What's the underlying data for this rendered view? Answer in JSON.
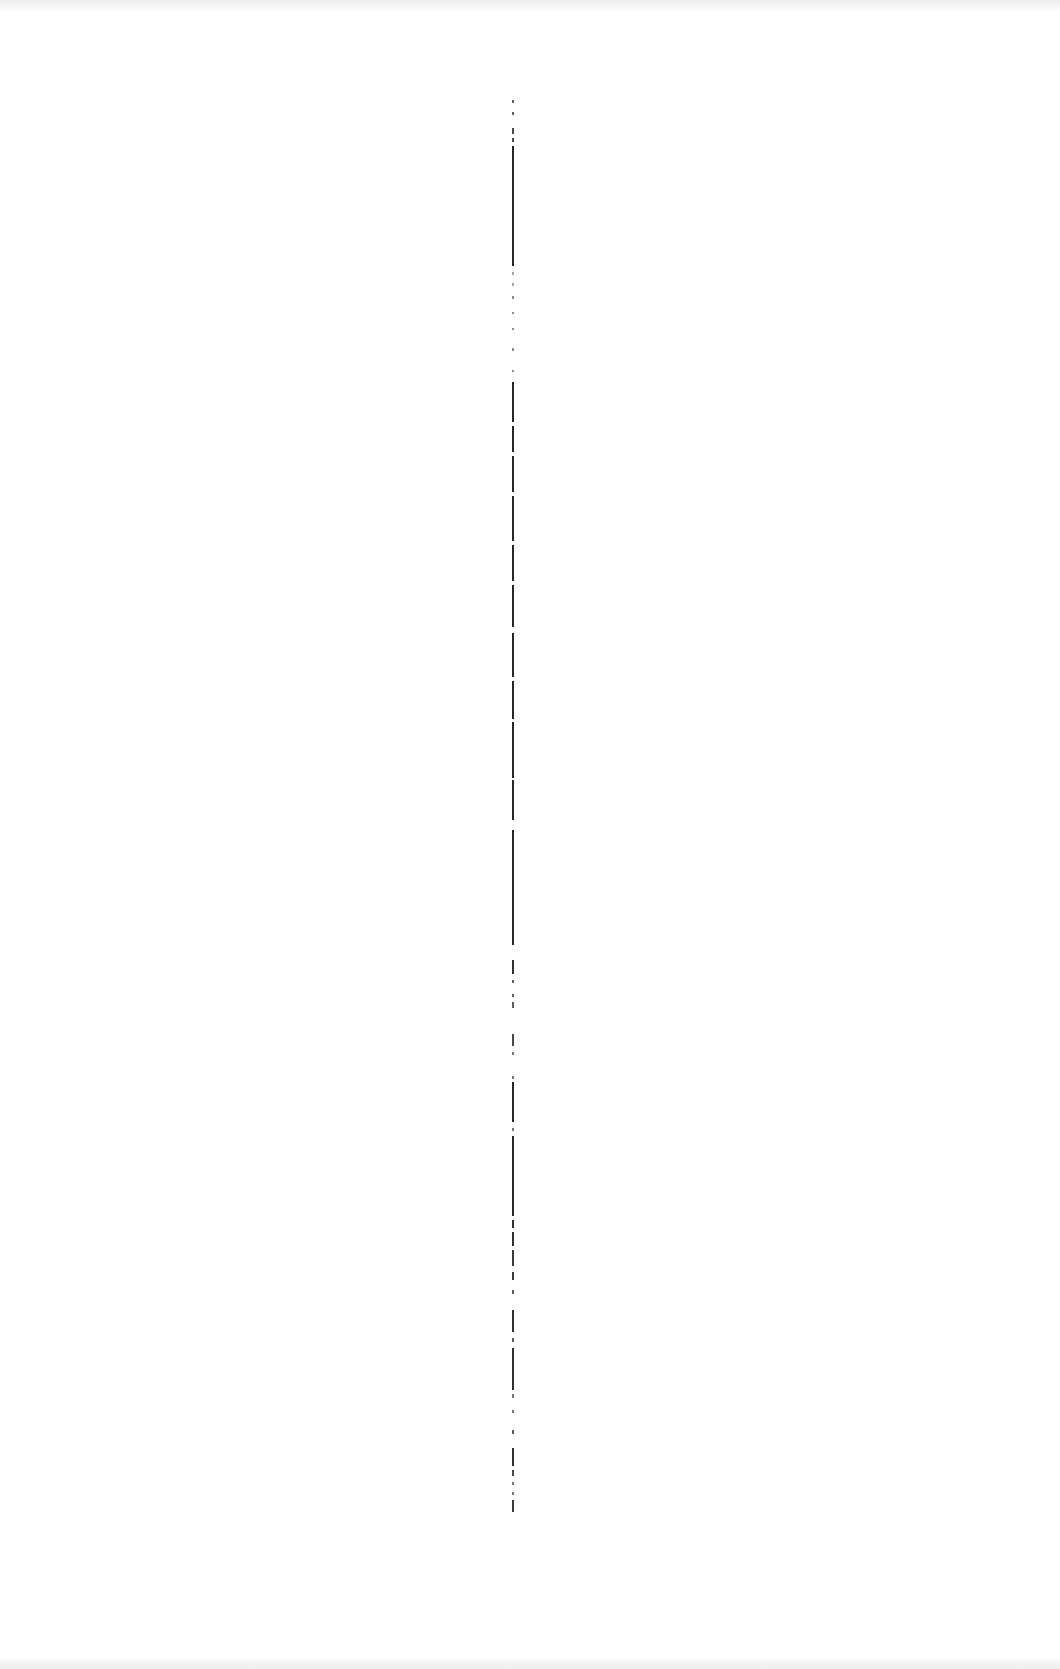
{
  "page": {
    "type": "scanned-page",
    "background": "#ffffff",
    "edge_band_color": "#ededed",
    "text_content": "",
    "legible_text": []
  },
  "column_rule": {
    "x": 512,
    "top": 100,
    "bottom": 1515,
    "color": "#1a1a1a",
    "segments": [
      {
        "y": 100,
        "h": 3,
        "op": 0.7
      },
      {
        "y": 112,
        "h": 3,
        "op": 0.7
      },
      {
        "y": 128,
        "h": 6,
        "op": 0.8
      },
      {
        "y": 138,
        "h": 4,
        "op": 0.8
      },
      {
        "y": 146,
        "h": 120,
        "op": 0.95
      },
      {
        "y": 272,
        "h": 3,
        "op": 0.4
      },
      {
        "y": 283,
        "h": 3,
        "op": 0.4
      },
      {
        "y": 296,
        "h": 3,
        "op": 0.5
      },
      {
        "y": 312,
        "h": 2,
        "op": 0.5
      },
      {
        "y": 328,
        "h": 2,
        "op": 0.5
      },
      {
        "y": 348,
        "h": 3,
        "op": 0.5
      },
      {
        "y": 370,
        "h": 2,
        "op": 0.5
      },
      {
        "y": 382,
        "h": 40,
        "op": 0.95
      },
      {
        "y": 426,
        "h": 26,
        "op": 0.95
      },
      {
        "y": 456,
        "h": 36,
        "op": 0.95
      },
      {
        "y": 496,
        "h": 45,
        "op": 0.95
      },
      {
        "y": 545,
        "h": 36,
        "op": 0.95
      },
      {
        "y": 585,
        "h": 42,
        "op": 0.95
      },
      {
        "y": 633,
        "h": 44,
        "op": 0.95
      },
      {
        "y": 681,
        "h": 38,
        "op": 0.95
      },
      {
        "y": 722,
        "h": 56,
        "op": 0.95
      },
      {
        "y": 780,
        "h": 40,
        "op": 0.95
      },
      {
        "y": 830,
        "h": 115,
        "op": 0.95
      },
      {
        "y": 960,
        "h": 14,
        "op": 0.9
      },
      {
        "y": 980,
        "h": 3,
        "op": 0.7
      },
      {
        "y": 994,
        "h": 3,
        "op": 0.7
      },
      {
        "y": 1002,
        "h": 6,
        "op": 0.7
      },
      {
        "y": 1034,
        "h": 12,
        "op": 0.8
      },
      {
        "y": 1052,
        "h": 3,
        "op": 0.6
      },
      {
        "y": 1076,
        "h": 3,
        "op": 0.6
      },
      {
        "y": 1082,
        "h": 40,
        "op": 0.95
      },
      {
        "y": 1128,
        "h": 3,
        "op": 0.6
      },
      {
        "y": 1136,
        "h": 80,
        "op": 0.95
      },
      {
        "y": 1220,
        "h": 8,
        "op": 0.9
      },
      {
        "y": 1232,
        "h": 14,
        "op": 0.9
      },
      {
        "y": 1250,
        "h": 16,
        "op": 0.85
      },
      {
        "y": 1272,
        "h": 8,
        "op": 0.85
      },
      {
        "y": 1290,
        "h": 4,
        "op": 0.7
      },
      {
        "y": 1310,
        "h": 22,
        "op": 0.9
      },
      {
        "y": 1338,
        "h": 4,
        "op": 0.7
      },
      {
        "y": 1348,
        "h": 42,
        "op": 0.9
      },
      {
        "y": 1394,
        "h": 4,
        "op": 0.6
      },
      {
        "y": 1410,
        "h": 3,
        "op": 0.6
      },
      {
        "y": 1430,
        "h": 4,
        "op": 0.7
      },
      {
        "y": 1448,
        "h": 18,
        "op": 0.9
      },
      {
        "y": 1470,
        "h": 6,
        "op": 0.8
      },
      {
        "y": 1482,
        "h": 3,
        "op": 0.6
      },
      {
        "y": 1492,
        "h": 3,
        "op": 0.6
      },
      {
        "y": 1500,
        "h": 12,
        "op": 0.85
      }
    ]
  }
}
